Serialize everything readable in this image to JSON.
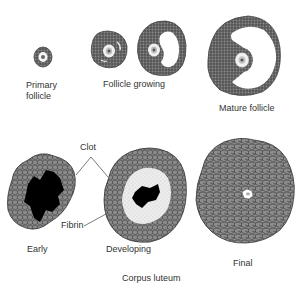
{
  "diagram": {
    "title": "Corpus luteum",
    "colors": {
      "stroke": "#333333",
      "follicle_fill": "#5a5a5a",
      "cell_fill": "#8a8a8a",
      "clot": "#000000",
      "fibrin": "#e8e8e8",
      "text": "#333333",
      "background": "#ffffff"
    },
    "top_row": {
      "primary_follicle": {
        "label_line1": "Primary",
        "label_line2": "follicle"
      },
      "follicle_growing": {
        "label": "Follicle growing"
      },
      "mature_follicle": {
        "label": "Mature follicle"
      }
    },
    "bottom_row": {
      "early": {
        "label": "Early"
      },
      "developing": {
        "label": "Developing"
      },
      "final": {
        "label": "Final"
      },
      "annotations": {
        "clot": "Clot",
        "fibrin": "Fibrin"
      },
      "group_label": "Corpus luteum"
    }
  }
}
